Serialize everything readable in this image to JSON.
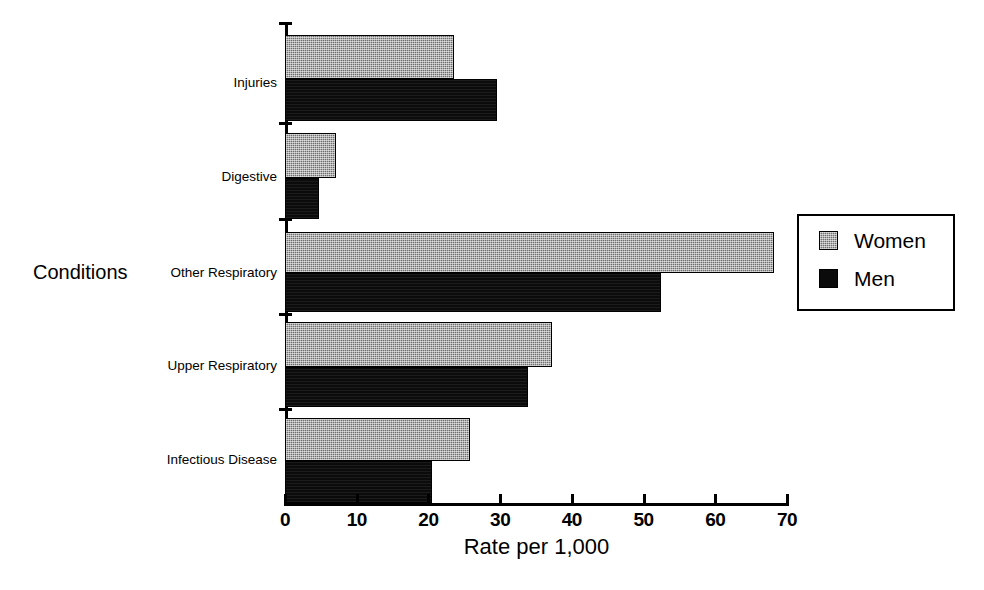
{
  "chart_data": {
    "type": "bar",
    "orientation": "horizontal",
    "title": "",
    "xlabel": "Rate per 1,000",
    "ylabel": "Conditions",
    "xlim": [
      0,
      70
    ],
    "xticks": [
      0,
      10,
      20,
      30,
      40,
      50,
      60,
      70
    ],
    "grid": false,
    "legend_position": "right",
    "categories": [
      "Injuries",
      "Digestive",
      "Other Respiratory",
      "Upper Respiratory",
      "Infectious Disease"
    ],
    "series": [
      {
        "name": "Women",
        "color": "#6e6e6e",
        "values": [
          23.5,
          7.1,
          68.2,
          37.2,
          25.8
        ]
      },
      {
        "name": "Men",
        "color": "#0b0b0b",
        "values": [
          29.5,
          4.8,
          52.4,
          33.9,
          20.5
        ]
      }
    ]
  },
  "legend": {
    "items": [
      {
        "label": "Women",
        "swatch": "women"
      },
      {
        "label": "Men",
        "swatch": "men"
      }
    ]
  },
  "axis": {
    "x_title": "Rate per 1,000",
    "y_title": "Conditions",
    "x_tick_labels": [
      "0",
      "10",
      "20",
      "30",
      "40",
      "50",
      "60",
      "70"
    ]
  }
}
